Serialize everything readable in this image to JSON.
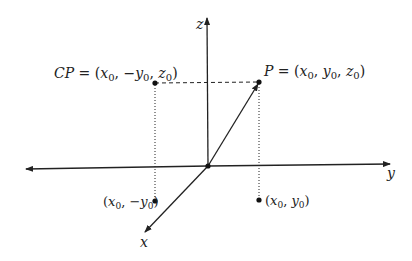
{
  "diagram": {
    "type": "3d-coordinate-axes",
    "axes": {
      "z_label": "z",
      "y_label": "y",
      "x_label": "x"
    },
    "points": {
      "P": {
        "name": "P",
        "equals": "=",
        "coords": "(x0, y0, z0)",
        "label_parts": [
          "P",
          " = (",
          "x",
          "0",
          ", ",
          "y",
          "0",
          ", ",
          "z",
          "0",
          ")"
        ]
      },
      "CP": {
        "name": "CP",
        "equals": "=",
        "coords": "(x0, −y0, z0)",
        "label_parts": [
          "CP",
          " = (",
          "x",
          "0",
          ", −",
          "y",
          "0",
          ", ",
          "z",
          "0",
          ")"
        ]
      },
      "proj_pos": {
        "coords": "(x0, y0)",
        "label_parts": [
          "(",
          "x",
          "0",
          ", ",
          "y",
          "0",
          ")"
        ]
      },
      "proj_neg": {
        "coords": "(x0, −y0)",
        "label_parts": [
          "(",
          "x",
          "0",
          ", −",
          "y",
          "0",
          ")"
        ]
      }
    },
    "colors": {
      "ink": "#222222",
      "background": "#ffffff"
    }
  }
}
